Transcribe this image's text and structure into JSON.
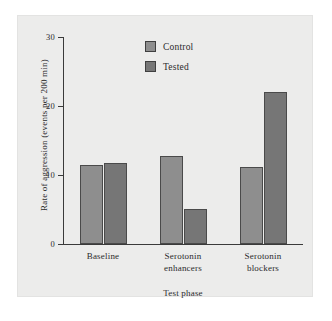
{
  "chart_data": {
    "type": "bar",
    "title": "",
    "xlabel": "Test phase",
    "ylabel": "Rate of aggression (events per 200 min)",
    "categories": [
      "Baseline",
      "Serotonin enhancers",
      "Serotonin blockers"
    ],
    "category_lines": [
      [
        "Baseline"
      ],
      [
        "Serotonin",
        "enhancers"
      ],
      [
        "Serotonin",
        "blockers"
      ]
    ],
    "series": [
      {
        "name": "Control",
        "color": "#8e8e8e",
        "values": [
          11.4,
          12.8,
          11.2
        ]
      },
      {
        "name": "Tested",
        "color": "#767676",
        "values": [
          11.8,
          5.1,
          22.0
        ]
      }
    ],
    "ylim": [
      0,
      30
    ],
    "yticks": [
      0,
      10,
      20,
      30
    ],
    "ytick_labels": [
      "0",
      "10",
      "20",
      "30"
    ],
    "grid": false,
    "legend_position": "top-center",
    "background_color": "#ececeb",
    "axis_color": "#3a3a3a"
  },
  "legend": {
    "entries": [
      {
        "label": "Control"
      },
      {
        "label": "Tested"
      }
    ]
  }
}
